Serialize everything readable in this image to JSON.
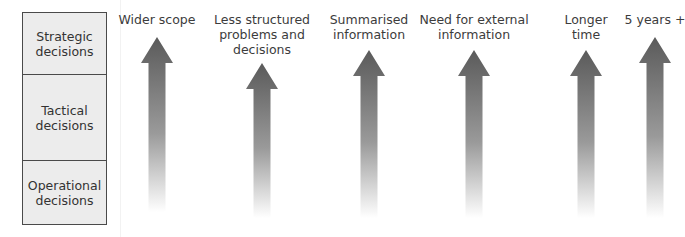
{
  "levels": [
    {
      "label": "Strategic decisions",
      "line1": "Strategic",
      "line2": "decisions"
    },
    {
      "label": "Tactical decisions",
      "line1": "Tactical",
      "line2": "decisions"
    },
    {
      "label": "Operational decisions",
      "line1": "Operational",
      "line2": "decisions"
    }
  ],
  "arrows": [
    {
      "lines": [
        "Wider scope"
      ],
      "cx": 157,
      "label_top": 12,
      "head_top": 37,
      "bottom": 212
    },
    {
      "lines": [
        "Less structured",
        "problems and",
        "decisions"
      ],
      "cx": 262,
      "label_top": 12,
      "head_top": 63,
      "bottom": 218
    },
    {
      "lines": [
        "Summarised",
        "information"
      ],
      "cx": 369,
      "label_top": 12,
      "head_top": 50,
      "bottom": 218
    },
    {
      "lines": [
        "Need for external",
        "information"
      ],
      "cx": 474,
      "label_top": 12,
      "head_top": 50,
      "bottom": 218
    },
    {
      "lines": [
        "Longer",
        "time"
      ],
      "cx": 586,
      "label_top": 12,
      "head_top": 50,
      "bottom": 218
    },
    {
      "lines": [
        "5 years +"
      ],
      "cx": 655,
      "label_top": 12,
      "head_top": 37,
      "bottom": 218
    }
  ],
  "colors": {
    "arrow_top": "#5a5a5a",
    "arrow_bottom": "#ffffff",
    "box_fill": "#ececec",
    "box_border": "#4a4a4a"
  }
}
